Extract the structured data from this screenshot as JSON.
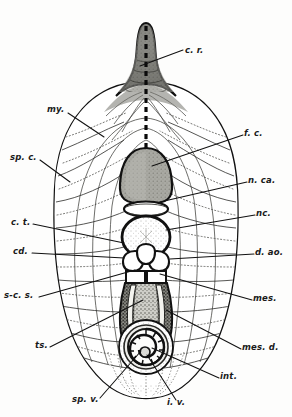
{
  "figure": {
    "kind": "anatomical-cross-section-illustration",
    "style": "monochrome stippled engraving",
    "colors": {
      "ink": "#111111",
      "paper": "#fdfdfc",
      "ectoderm_fill": "#ffffff",
      "myotome_fill": "#f2f1ec",
      "funicular_cord_fill": "#9a9a95",
      "mesenchyme_fill": "#6e6e6a",
      "notochord_fill": "#f7f7f4",
      "leader_line": "#111111"
    }
  },
  "labels": [
    {
      "id": "c-r",
      "text": "c. r.",
      "side": "right",
      "x": 185,
      "y": 51,
      "lead_to": [
        138,
        66
      ]
    },
    {
      "id": "my",
      "text": "my.",
      "side": "left",
      "x": 47,
      "y": 110,
      "lead_to": [
        104,
        137
      ]
    },
    {
      "id": "f-c",
      "text": "f. c.",
      "side": "right",
      "x": 244,
      "y": 133,
      "lead_to": [
        152,
        166
      ]
    },
    {
      "id": "sp-c",
      "text": "sp. c.",
      "side": "left",
      "x": 10,
      "y": 157,
      "lead_to": [
        68,
        180
      ]
    },
    {
      "id": "n-ca",
      "text": "n. ca.",
      "side": "right",
      "x": 248,
      "y": 180,
      "lead_to": [
        158,
        196
      ]
    },
    {
      "id": "nc",
      "text": "nc.",
      "side": "right",
      "x": 256,
      "y": 213,
      "lead_to": [
        150,
        222
      ]
    },
    {
      "id": "c-t",
      "text": "c. t.",
      "side": "left",
      "x": 11,
      "y": 222,
      "lead_to": [
        124,
        240
      ]
    },
    {
      "id": "cd",
      "text": "cd.",
      "side": "left",
      "x": 13,
      "y": 251,
      "lead_to": [
        128,
        256
      ]
    },
    {
      "id": "d-ao",
      "text": "d. ao.",
      "side": "right",
      "x": 255,
      "y": 252,
      "lead_to": [
        160,
        257
      ]
    },
    {
      "id": "s-c-s",
      "text": "s-c. s.",
      "side": "left",
      "x": 4,
      "y": 295,
      "lead_to": [
        131,
        268
      ]
    },
    {
      "id": "mes",
      "text": "mes.",
      "side": "right",
      "x": 253,
      "y": 298,
      "lead_to": [
        156,
        275
      ]
    },
    {
      "id": "ts",
      "text": "ts.",
      "side": "left",
      "x": 35,
      "y": 345,
      "lead_to": [
        142,
        300
      ]
    },
    {
      "id": "mes-d",
      "text": "mes. d.",
      "side": "right",
      "x": 242,
      "y": 347,
      "lead_to": [
        160,
        313
      ]
    },
    {
      "id": "int",
      "text": "int.",
      "side": "right",
      "x": 220,
      "y": 376,
      "lead_to": [
        150,
        348
      ]
    },
    {
      "id": "sp-v",
      "text": "sp. v.",
      "side": "left",
      "x": 72,
      "y": 399,
      "lead_to": [
        140,
        352
      ]
    },
    {
      "id": "i-v",
      "text": "i. v.",
      "side": "left",
      "x": 167,
      "y": 402,
      "lead_to": [
        145,
        356
      ]
    }
  ],
  "structures": [
    {
      "id": "caudal-rod",
      "label_ref": "c-r",
      "name": "caudal rod / tail spike"
    },
    {
      "id": "myotome",
      "label_ref": "my",
      "name": "myotome"
    },
    {
      "id": "funicular-cord",
      "label_ref": "f-c",
      "name": "funicular cord"
    },
    {
      "id": "spinal-cord",
      "label_ref": "sp-c",
      "name": "spinal cord"
    },
    {
      "id": "neural-canal",
      "label_ref": "n-ca",
      "name": "neural canal"
    },
    {
      "id": "notochord",
      "label_ref": "nc",
      "name": "notochord"
    },
    {
      "id": "connective-tissue",
      "label_ref": "c-t",
      "name": "connective tissue"
    },
    {
      "id": "cardinal-vein",
      "label_ref": "cd",
      "name": "cardinal vein"
    },
    {
      "id": "dorsal-aorta",
      "label_ref": "d-ao",
      "name": "dorsal aorta"
    },
    {
      "id": "subchordal-space",
      "label_ref": "s-c-s",
      "name": "sub-chordal space"
    },
    {
      "id": "mesentery",
      "label_ref": "mes",
      "name": "mesentery"
    },
    {
      "id": "tissue-septum",
      "label_ref": "ts",
      "name": "tissue septum"
    },
    {
      "id": "mesoderm-dorsal",
      "label_ref": "mes-d",
      "name": "mesoderm, dorsal"
    },
    {
      "id": "intestine",
      "label_ref": "int",
      "name": "intestine"
    },
    {
      "id": "spiral-valve",
      "label_ref": "sp-v",
      "name": "spiral valve"
    },
    {
      "id": "intestinal-vein",
      "label_ref": "i-v",
      "name": "intestinal vein"
    }
  ]
}
